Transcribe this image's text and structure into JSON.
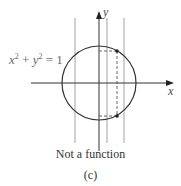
{
  "figure": {
    "equation": {
      "x": "x",
      "y": "y",
      "exp": "2",
      "plus": " + ",
      "equals": " = 1"
    },
    "axis_labels": {
      "x": "x",
      "y": "y"
    },
    "caption": "Not a function",
    "subfigure_label": "(c)"
  },
  "geometry": {
    "circle": {
      "cx": 99,
      "cy": 83,
      "r": 37
    },
    "vertical_lines_x": [
      75,
      107,
      124
    ],
    "test_line_x": 117,
    "intersection_points": [
      [
        117,
        51
      ],
      [
        117,
        116
      ]
    ]
  },
  "colors": {
    "curve": "#333333",
    "axes": "#333333",
    "lines": "#8a8a8a",
    "dashed": "#555555"
  }
}
